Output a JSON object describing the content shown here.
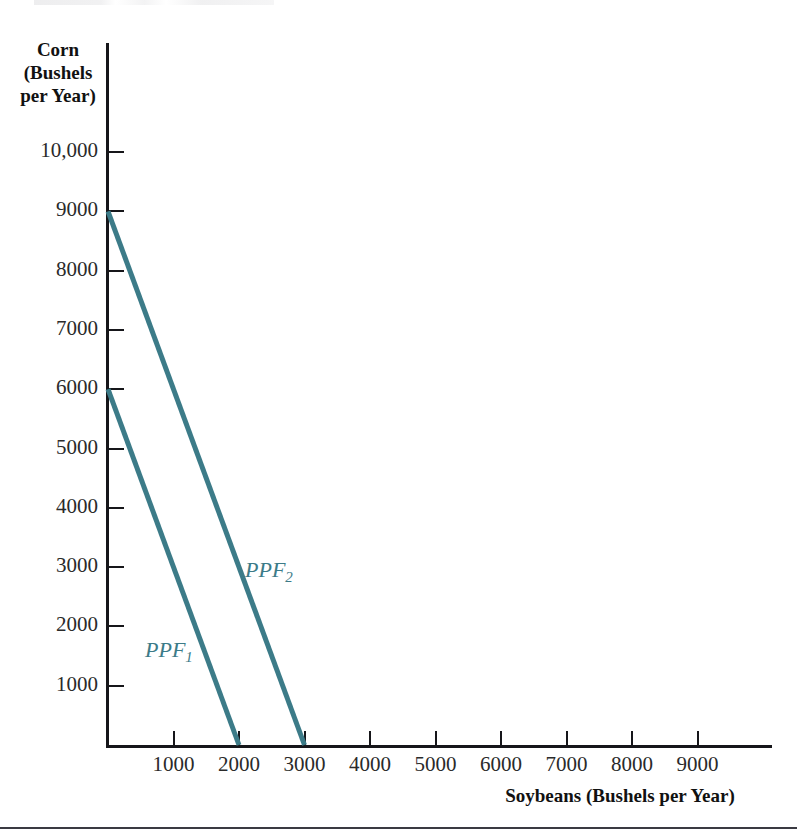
{
  "figure": {
    "background_color": "#ffffff",
    "line_color": "#3c7b88",
    "axis_color": "#16161a",
    "label_color": "#2a2a2a"
  },
  "caption_remnant": "",
  "chart_data": {
    "type": "line",
    "title": "",
    "xlabel": "Soybeans (Bushels per Year)",
    "ylabel": "Corn (Bushels per Year)",
    "ylabel_lines": [
      "Corn",
      "(Bushels",
      "per Year)"
    ],
    "xlim": [
      0,
      9800
    ],
    "ylim": [
      0,
      10800
    ],
    "grid": false,
    "legend_position": "inline-annotation",
    "xticks": [
      1000,
      2000,
      3000,
      4000,
      5000,
      6000,
      7000,
      8000,
      9000
    ],
    "xtick_labels": [
      "1000",
      "2000",
      "3000",
      "4000",
      "5000",
      "6000",
      "7000",
      "8000",
      "9000"
    ],
    "yticks": [
      1000,
      2000,
      3000,
      4000,
      5000,
      6000,
      7000,
      8000,
      9000,
      10000
    ],
    "ytick_labels": [
      "1000",
      "2000",
      "3000",
      "4000",
      "5000",
      "6000",
      "7000",
      "8000",
      "9000",
      "10,000"
    ],
    "series": [
      {
        "name": "PPF1",
        "label": "PPF",
        "subscript": "1",
        "color": "#3c7b88",
        "x": [
          0,
          2000
        ],
        "values": [
          6000,
          0
        ],
        "y_intercept": 6000,
        "x_intercept": 2000,
        "slope": -3
      },
      {
        "name": "PPF2",
        "label": "PPF",
        "subscript": "2",
        "color": "#3c7b88",
        "x": [
          0,
          3000
        ],
        "values": [
          9000,
          0
        ],
        "y_intercept": 9000,
        "x_intercept": 3000,
        "slope": -3
      }
    ]
  }
}
